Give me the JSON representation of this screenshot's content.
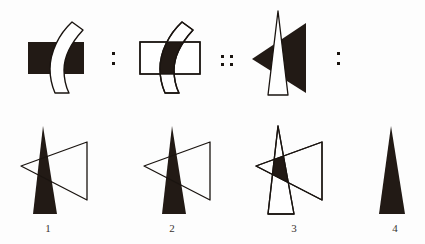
{
  "puzzle": {
    "type": "visual-analogy-matrix",
    "prompt_row": {
      "items": [
        {
          "id": "figure-a",
          "name": "dark-rectangle-with-white-curved-band",
          "shapes": [
            {
              "shape": "rectangle",
              "fill": "#221a15",
              "stroke": "none"
            },
            {
              "shape": "curved-band",
              "fill": "#ffffff",
              "stroke": "#1a1410"
            }
          ]
        },
        {
          "id": "figure-b",
          "name": "white-rectangle-with-dark-band-overlap",
          "shapes": [
            {
              "shape": "rectangle",
              "fill": "#ffffff",
              "stroke": "#1a1410"
            },
            {
              "shape": "curved-band",
              "fill": "#ffffff",
              "stroke": "#1a1410"
            },
            {
              "shape": "overlap-region",
              "fill": "#221a15",
              "stroke": "none"
            }
          ]
        },
        {
          "id": "figure-c",
          "name": "dark-left-triangle-with-white-narrow-triangle",
          "shapes": [
            {
              "shape": "left-pointing-triangle",
              "fill": "#221a15",
              "stroke": "none"
            },
            {
              "shape": "narrow-tall-triangle",
              "fill": "#ffffff",
              "stroke": "#1a1410"
            }
          ]
        }
      ],
      "separators": [
        "colon",
        "double-colon",
        "colon"
      ]
    },
    "answer_row": {
      "options": [
        {
          "number": "1",
          "name": "dark-narrow-triangle-with-white-left-triangle-outline",
          "shapes": [
            {
              "shape": "narrow-tall-triangle",
              "fill": "#221a15",
              "stroke": "none"
            },
            {
              "shape": "left-pointing-triangle",
              "fill": "none",
              "stroke": "#1a1410"
            }
          ]
        },
        {
          "number": "2",
          "name": "dark-narrow-triangle-shifted-with-left-triangle-outline",
          "shapes": [
            {
              "shape": "narrow-tall-triangle",
              "fill": "#221a15",
              "stroke": "none"
            },
            {
              "shape": "left-pointing-triangle",
              "fill": "none",
              "stroke": "#1a1410"
            }
          ]
        },
        {
          "number": "3",
          "name": "outlined-triangles-with-dark-overlap-region",
          "shapes": [
            {
              "shape": "narrow-tall-triangle",
              "fill": "none",
              "stroke": "#1a1410"
            },
            {
              "shape": "left-pointing-triangle",
              "fill": "none",
              "stroke": "#1a1410"
            },
            {
              "shape": "overlap-region",
              "fill": "#221a15",
              "stroke": "none"
            }
          ]
        },
        {
          "number": "4",
          "name": "solid-dark-narrow-triangle",
          "shapes": [
            {
              "shape": "narrow-tall-triangle",
              "fill": "#221a15",
              "stroke": "none"
            }
          ]
        }
      ]
    },
    "colors": {
      "ink": "#221a15",
      "outline": "#1a1410",
      "paper": "#fdfdfd",
      "label": "#3a3330"
    },
    "labels": {
      "option_1": "1",
      "option_2": "2",
      "option_3": "3",
      "option_4": "4"
    }
  }
}
